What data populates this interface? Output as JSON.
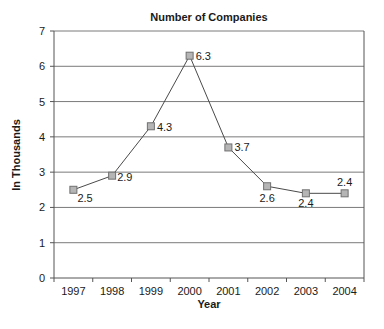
{
  "chart_data": {
    "type": "line",
    "title": "Number of Companies",
    "xlabel": "Year",
    "ylabel": "In Thousands",
    "categories": [
      "1997",
      "1998",
      "1999",
      "2000",
      "2001",
      "2002",
      "2003",
      "2004"
    ],
    "series": [
      {
        "name": "Number of Companies",
        "values": [
          2.5,
          2.9,
          4.3,
          6.3,
          3.7,
          2.6,
          2.4,
          2.4
        ],
        "data_labels": [
          "2.5",
          "2.9",
          "4.3",
          "6.3",
          "3.7",
          "2.6",
          "2.4",
          "2.4"
        ]
      }
    ],
    "ylim": [
      0,
      7
    ],
    "yticks": [
      0,
      1,
      2,
      3,
      4,
      5,
      6,
      7
    ],
    "grid": true,
    "legend": "none",
    "colors": {
      "line": "#4a4a4a",
      "marker_fill": "#b5b5b5",
      "marker_stroke": "#707070",
      "grid": "#7a7a7a",
      "axis": "#555555"
    }
  }
}
